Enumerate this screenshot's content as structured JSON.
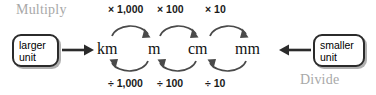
{
  "diagram": {
    "captions": {
      "multiply": "Multiply",
      "divide": "Divide"
    },
    "boxes": {
      "larger": {
        "line1": "larger",
        "line2": "unit"
      },
      "smaller": {
        "line1": "smaller",
        "line2": "unit"
      }
    },
    "units": [
      {
        "label": "km"
      },
      {
        "label": "m"
      },
      {
        "label": "cm"
      },
      {
        "label": "mm"
      }
    ],
    "multiply_labels": [
      "× 1,000",
      "× 100",
      "× 10"
    ],
    "divide_labels": [
      "÷ 1,000",
      "÷ 100",
      "÷ 10"
    ],
    "colors": {
      "caption_gray": "#a8a8a8",
      "text_black": "#111111",
      "arrow_dark": "#2b2b2b",
      "arc_gray": "#4a4a4a",
      "background": "#ffffff"
    }
  }
}
